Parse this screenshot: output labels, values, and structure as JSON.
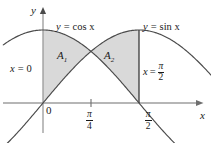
{
  "figure": {
    "axes": {
      "x_axis_label": "x",
      "y_axis_label": "y",
      "origin_label": "0"
    },
    "ticks": [
      {
        "name": "pi-over-4",
        "numerator": "π",
        "denominator": "4"
      },
      {
        "name": "pi-over-2",
        "numerator": "π",
        "denominator": "2"
      }
    ],
    "curve_labels": {
      "cosine": {
        "lhs": "y",
        "eq": "=",
        "rhs": "cos x"
      },
      "sine": {
        "lhs": "y",
        "eq": "=",
        "rhs": "sin x"
      }
    },
    "boundary_labels": {
      "left": {
        "text": "x = 0",
        "var": "x",
        "eq": "=",
        "value": "0"
      },
      "right": {
        "var": "x",
        "eq": "=",
        "numerator": "π",
        "denominator": "2"
      }
    },
    "regions": [
      {
        "name": "A1",
        "base": "A",
        "subscript": "1"
      },
      {
        "name": "A2",
        "base": "A",
        "subscript": "2"
      }
    ],
    "colors": {
      "shade_fill": "#d9d9d9",
      "curve_stroke": "#4a4a4a",
      "axis_stroke": "#6e6e6e",
      "boundary_stroke": "#3a3a3a",
      "text": "#1a1a1a",
      "background": "#ffffff"
    }
  },
  "chart_data": {
    "type": "line",
    "xlabel": "x",
    "ylabel": "y",
    "xlim": [
      -0.65,
      2.95
    ],
    "ylim": [
      -0.55,
      1.25
    ],
    "grid": false,
    "legend": "inline-curve-labels",
    "series": [
      {
        "name": "y = cos x",
        "expression": "cos(x)",
        "x": [
          -0.65,
          -0.4,
          -0.2,
          0,
          0.3927,
          0.7854,
          1.1781,
          1.5708,
          1.9635,
          2.3562,
          2.75,
          2.95
        ],
        "values": [
          0.796,
          0.921,
          0.98,
          1.0,
          0.924,
          0.707,
          0.383,
          0.0,
          -0.383,
          -0.707,
          -0.924,
          -0.981
        ]
      },
      {
        "name": "y = sin x",
        "expression": "sin(x)",
        "x": [
          -0.65,
          -0.4,
          -0.2,
          0,
          0.3927,
          0.7854,
          1.1781,
          1.5708,
          1.9635,
          2.3562,
          2.75,
          2.95
        ],
        "values": [
          -0.605,
          -0.389,
          -0.199,
          0.0,
          0.383,
          0.707,
          0.924,
          1.0,
          0.924,
          0.707,
          0.382,
          0.192
        ]
      }
    ],
    "intersection": {
      "x": 0.7854,
      "y": 0.7071,
      "label": "pi/4"
    },
    "shaded_regions": [
      {
        "label": "A1",
        "x_from": 0,
        "x_to": 0.7854,
        "upper": "cos(x)",
        "lower": "sin(x)"
      },
      {
        "label": "A2",
        "x_from": 0.7854,
        "x_to": 1.5708,
        "upper": "sin(x)",
        "lower": "cos(x)"
      }
    ],
    "annotations": [
      {
        "text": "y = cos x",
        "x": 0.25,
        "y": 1.13
      },
      {
        "text": "y = sin x",
        "x": 1.85,
        "y": 1.13
      },
      {
        "text": "x = 0",
        "x": -0.45,
        "y": 0.43
      },
      {
        "text": "x = pi/2",
        "x": 1.62,
        "y": 0.43
      },
      {
        "text": "A1",
        "x": 0.42,
        "y": 0.55
      },
      {
        "text": "A2",
        "x": 1.15,
        "y": 0.55
      }
    ],
    "xticks": [
      0,
      0.7854,
      1.5708
    ],
    "xticklabels": [
      "0",
      "pi/4",
      "pi/2"
    ]
  }
}
